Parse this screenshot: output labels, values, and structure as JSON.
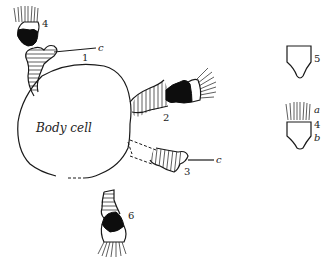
{
  "diagram": {
    "body_cell_label": "Body cell",
    "structures": [
      {
        "id": "1",
        "label": "1",
        "pointer": "c",
        "description": "hatched stalk with bifurcated tip, upper left"
      },
      {
        "id": "2",
        "label": "2",
        "description": "hatched stalk with black band and ciliated tip, right"
      },
      {
        "id": "3",
        "label": "3",
        "pointer": "c",
        "description": "hatched stalk with dashed connection, lower right"
      },
      {
        "id": "4",
        "label": "4",
        "description": "detached ciliated cell with black base, top left"
      },
      {
        "id": "6",
        "label": "6",
        "description": "hatched stalk with black band and cilia, bottom"
      }
    ],
    "side_figures": [
      {
        "id": "5",
        "label": "5",
        "description": "empty cup-shaped cell outline"
      },
      {
        "id": "4b",
        "label": "4",
        "sub_labels": [
          "a",
          "b"
        ],
        "description": "cup-shaped cell with cilia"
      }
    ]
  }
}
